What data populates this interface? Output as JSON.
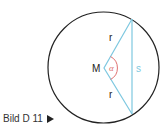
{
  "diagram": {
    "caption": "Bild D 11",
    "caption_icon": "play-arrow-icon",
    "labels": {
      "center": "M",
      "radius_top": "r",
      "radius_bottom": "r",
      "angle": "α",
      "chord": "s"
    },
    "colors": {
      "circle": "#222222",
      "triangle": "#7ec8e0",
      "angle_arc": "#e07070",
      "angle_label": "#e07070",
      "chord_label": "#7ec8e0",
      "text": "#222222"
    },
    "geometry": {
      "circle": {
        "cx": 103.5,
        "cy": 67.5,
        "r": 55.5
      },
      "center_point": {
        "x": 104,
        "y": 68
      },
      "chord_top": {
        "x": 132,
        "y": 19
      },
      "chord_bottom": {
        "x": 132,
        "y": 114
      }
    }
  }
}
